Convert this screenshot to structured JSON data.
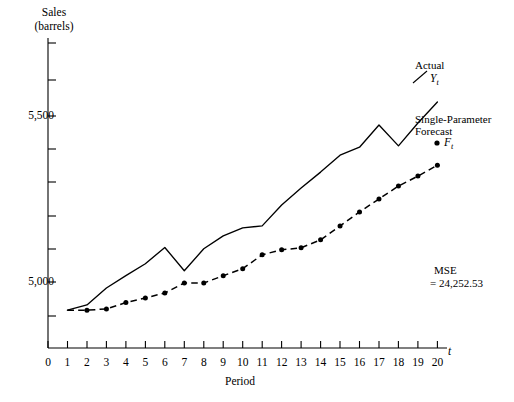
{
  "axes": {
    "y_title_line1": "Sales",
    "y_title_line2": "(barrels)",
    "y_ticks_labeled": [
      "5,000",
      "5,500"
    ],
    "x_title": "Period",
    "x_symbol": "t",
    "x_ticks": [
      "0",
      "1",
      "2",
      "3",
      "4",
      "5",
      "6",
      "7",
      "8",
      "9",
      "10",
      "11",
      "12",
      "13",
      "14",
      "15",
      "16",
      "17",
      "18",
      "19",
      "20"
    ]
  },
  "annotations": {
    "actual_label": "Actual",
    "actual_symbol_base": "Y",
    "actual_symbol_sub": "t",
    "forecast_label_line1": "Single-Parameter",
    "forecast_label_line2": "Forecast",
    "forecast_symbol_base": "F",
    "forecast_symbol_sub": "t",
    "mse_line1": "MSE",
    "mse_line2": "= 24,252.53"
  },
  "colors": {
    "line": "#000000",
    "axis": "#000000",
    "background": "#ffffff"
  },
  "chart_data": {
    "type": "line",
    "title": "",
    "subtitle": "",
    "xlabel": "Period",
    "ylabel": "Sales (barrels)",
    "xlim": [
      0,
      20
    ],
    "ylim": [
      4880,
      5700
    ],
    "grid": false,
    "legend_position": "inline-right",
    "x": [
      1,
      2,
      3,
      4,
      5,
      6,
      7,
      8,
      9,
      10,
      11,
      12,
      13,
      14,
      15,
      16,
      17,
      18,
      19,
      20
    ],
    "series": [
      {
        "name": "Actual Yt",
        "style": "solid",
        "markers": false,
        "values": [
          4915,
          4931,
          4982,
          5019,
          5055,
          5104,
          5034,
          5100,
          5139,
          5163,
          5169,
          5232,
          5283,
          5331,
          5382,
          5406,
          5473,
          5410,
          5479,
          5542
        ]
      },
      {
        "name": "Single-Parameter Forecast Ft",
        "style": "dashed",
        "markers": true,
        "values": [
          4915,
          4915,
          4919,
          4938,
          4952,
          4967,
          4997,
          4997,
          5019,
          5040,
          5082,
          5097,
          5103,
          5127,
          5169,
          5211,
          5250,
          5289,
          5319,
          5352
        ]
      }
    ],
    "mse": 24252.53
  }
}
